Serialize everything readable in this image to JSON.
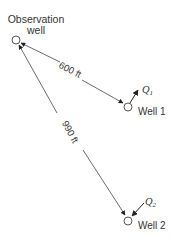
{
  "observation_well": {
    "label_line1": "Observation",
    "label_line2": "well"
  },
  "well1": {
    "label": "Well 1",
    "discharge_label": "Q",
    "discharge_sub": "1",
    "distance_label": "600 ft"
  },
  "well2": {
    "label": "Well 2",
    "discharge_label": "Q",
    "discharge_sub": "2",
    "distance_label": "990 ft"
  },
  "colors": {
    "line": "#444444",
    "text": "#333333",
    "background": "#ffffff"
  }
}
